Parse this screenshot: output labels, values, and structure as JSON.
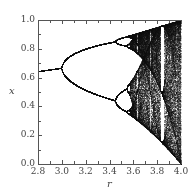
{
  "chart_data": {
    "type": "scatter",
    "title": "",
    "xlabel": "r",
    "ylabel": "x",
    "xlim": [
      2.8,
      4.0
    ],
    "ylim": [
      0.0,
      1.0
    ],
    "xticks": [
      2.8,
      3.0,
      3.2,
      3.4,
      3.6,
      3.8,
      4.0
    ],
    "yticks": [
      0.0,
      0.2,
      0.4,
      0.6,
      0.8,
      1.0
    ],
    "xtick_labels": [
      "2.8",
      "3.0",
      "3.2",
      "3.4",
      "3.6",
      "3.8",
      "4.0"
    ],
    "ytick_labels": [
      "0.0",
      "0.2",
      "0.4",
      "0.6",
      "0.8",
      "1.0"
    ],
    "grid": false,
    "legend": null,
    "series": [
      {
        "name": "logistic map x(n+1) = r x(n) (1 - x(n)) attractor",
        "description": "Bifurcation diagram: single fixed point up to r=3.0 (x from ~0.64 to ~0.67), period-2 branches from r=3.0 to ~3.45 (upper ~0.85, lower ~0.44 at r=3.45), period-4 from ~3.45 to ~3.54, chaos beyond ~3.57 bounded above by 1.0 at r=4 and below to 0.0 at r=4, periodic windows near r~3.63, 3.74 and 3.83-3.86",
        "sample_points": [
          {
            "r": 2.8,
            "x": [
              0.643
            ]
          },
          {
            "r": 2.9,
            "x": [
              0.655
            ]
          },
          {
            "r": 3.0,
            "x": [
              0.667
            ]
          },
          {
            "r": 3.2,
            "x": [
              0.513,
              0.799
            ]
          },
          {
            "r": 3.4,
            "x": [
              0.452,
              0.842
            ]
          },
          {
            "r": 3.5,
            "x": [
              0.383,
              0.501,
              0.827,
              0.875
            ]
          },
          {
            "r": 3.83,
            "x": [
              0.156,
              0.505,
              0.957
            ]
          },
          {
            "r": 4.0,
            "x_range": [
              0.0,
              1.0
            ]
          }
        ],
        "color": "#000000"
      }
    ]
  },
  "render": {
    "iterations_transient": 300,
    "iterations_plot": 220,
    "point_color": "#111111",
    "axis_color": "#555555"
  }
}
